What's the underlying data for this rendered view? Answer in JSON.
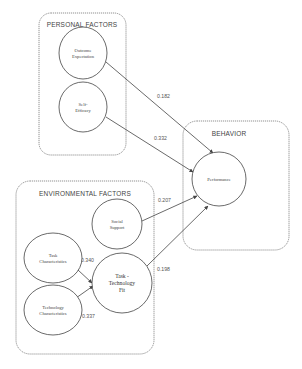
{
  "diagram": {
    "groups": [
      {
        "id": "personal",
        "title": "PERSONAL  FACTORS",
        "x": 39,
        "y": 13,
        "w": 87,
        "h": 142,
        "rx": 12,
        "title_x": 82,
        "title_y": 27
      },
      {
        "id": "behavior",
        "title": "BEHAVIOR",
        "x": 183,
        "y": 121,
        "w": 106,
        "h": 129,
        "rx": 14,
        "title_x": 229,
        "title_y": 136
      },
      {
        "id": "environmental",
        "title": "ENVIRONMENTAL  FACTORS",
        "x": 16,
        "y": 181,
        "w": 138,
        "h": 173,
        "rx": 14,
        "title_x": 85,
        "title_y": 196
      }
    ],
    "nodes": [
      {
        "id": "outcome",
        "lines": [
          "Outcome",
          "Expectation"
        ],
        "cx": 83,
        "cy": 53,
        "rx": 24,
        "ry": 26,
        "size": "sm"
      },
      {
        "id": "selfeff",
        "lines": [
          "Self-",
          "Efficacy"
        ],
        "cx": 83,
        "cy": 107,
        "rx": 24,
        "ry": 25,
        "size": "sm"
      },
      {
        "id": "performance",
        "lines": [
          "Performance"
        ],
        "cx": 219,
        "cy": 179,
        "rx": 27,
        "ry": 27,
        "size": "sm"
      },
      {
        "id": "social",
        "lines": [
          "Social",
          "Support"
        ],
        "cx": 117,
        "cy": 224,
        "rx": 25,
        "ry": 25,
        "size": "sm"
      },
      {
        "id": "taskchar",
        "lines": [
          "Task",
          "Characteristics"
        ],
        "cx": 53,
        "cy": 258,
        "rx": 29,
        "ry": 25,
        "size": "sm"
      },
      {
        "id": "techchar",
        "lines": [
          "Technology",
          "Characteristics"
        ],
        "cx": 53,
        "cy": 310,
        "rx": 29,
        "ry": 25,
        "size": "sm"
      },
      {
        "id": "ttf",
        "lines": [
          "Task -",
          "Technology",
          "Fit"
        ],
        "cx": 122,
        "cy": 283,
        "rx": 30,
        "ry": 30,
        "size": "lg"
      }
    ],
    "edges": [
      {
        "from": "outcome",
        "to": "performance",
        "coef": "0.182",
        "x1": 106,
        "y1": 62,
        "x2": 213,
        "y2": 153,
        "lx": 157,
        "ly": 98
      },
      {
        "from": "selfeff",
        "to": "performance",
        "coef": "0.332",
        "x1": 106,
        "y1": 117,
        "x2": 193,
        "y2": 172,
        "lx": 154,
        "ly": 140
      },
      {
        "from": "social",
        "to": "performance",
        "coef": "0.207",
        "x1": 142,
        "y1": 221,
        "x2": 197,
        "y2": 196,
        "lx": 158,
        "ly": 202
      },
      {
        "from": "ttf",
        "to": "performance",
        "coef": "0.198",
        "x1": 147,
        "y1": 266,
        "x2": 208,
        "y2": 206,
        "lx": 157,
        "ly": 271
      },
      {
        "from": "taskchar",
        "to": "ttf",
        "coef": "0.340",
        "x1": 78,
        "y1": 270,
        "x2": 92,
        "y2": 283,
        "lx": 81,
        "ly": 262
      },
      {
        "from": "techchar",
        "to": "ttf",
        "coef": "0.337",
        "x1": 76,
        "y1": 298,
        "x2": 93,
        "y2": 286,
        "lx": 82,
        "ly": 318
      }
    ]
  }
}
